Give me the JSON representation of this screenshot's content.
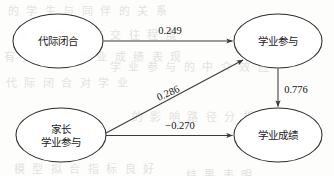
{
  "diagram": {
    "type": "path-diagram",
    "title": "",
    "background_color": "#fdfdfc",
    "line_color": "#3a3a3a",
    "node_fill": "#ffffff",
    "node_stroke": "#2d2d2d",
    "nodes": [
      {
        "id": "intergenerational-closure",
        "line1": "代际闭合",
        "line2": "",
        "cx": 58,
        "cy": 41,
        "rx": 45,
        "ry": 27
      },
      {
        "id": "academic-engagement",
        "line1": "学业参与",
        "line2": "",
        "cx": 278,
        "cy": 41,
        "rx": 44,
        "ry": 27
      },
      {
        "id": "parental-involvement",
        "line1": "家长",
        "line2": "学业参与",
        "cx": 61,
        "cy": 135,
        "rx": 45,
        "ry": 27
      },
      {
        "id": "academic-achievement",
        "line1": "学业成绩",
        "line2": "",
        "cx": 278,
        "cy": 135,
        "rx": 44,
        "ry": 27
      }
    ],
    "edges": [
      {
        "id": "closure-to-engagement",
        "coefficient": "0.249",
        "label_x": 170,
        "label_y": 30,
        "rotated": false
      },
      {
        "id": "engagement-to-achievement",
        "coefficient": "0.776",
        "label_x": 296,
        "label_y": 89,
        "rotated": false
      },
      {
        "id": "involvement-to-engagement",
        "coefficient": "0.286",
        "label_x": 168,
        "label_y": 93,
        "rotated": true
      },
      {
        "id": "involvement-to-achievement",
        "coefficient": "−0.270",
        "label_x": 180,
        "label_y": 125,
        "rotated": false
      }
    ],
    "bleed_marks": [
      {
        "text": "的 学 生 与 同 伴 的 关 系",
        "x": 8,
        "y": 2
      },
      {
        "text": "家 长 之 间 的 交 往 程 度",
        "x": 18,
        "y": 26
      },
      {
        "text": "有 更 高 的 学 业 成 绩 表 现",
        "x": 4,
        "y": 48
      },
      {
        "text": "学 业 参 与 的 中 介 效 应",
        "x": 110,
        "y": 58
      },
      {
        "text": "代 际 闭 合 对 学 业",
        "x": 6,
        "y": 74
      },
      {
        "text": "的 影 响 路 径 分 析",
        "x": 132,
        "y": 108
      },
      {
        "text": "模 型 拟 合 指 标 良 好",
        "x": 14,
        "y": 160
      },
      {
        "text": "结 果 表 明",
        "x": 186,
        "y": 166
      }
    ]
  }
}
